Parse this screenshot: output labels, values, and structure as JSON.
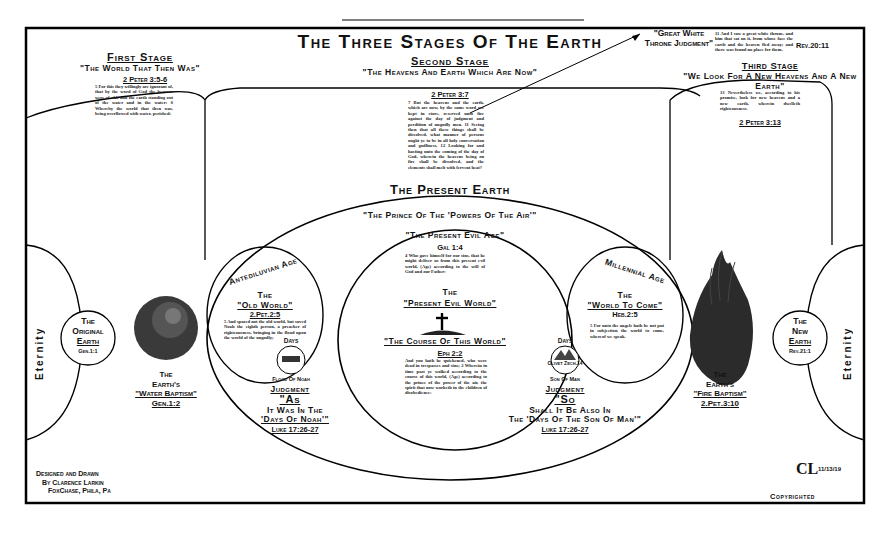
{
  "title": "The Three Stages Of The Earth",
  "first_stage": {
    "heading": "First Stage",
    "subtitle": "\"The World That Then Was\"",
    "reference": "2 Peter 3:5-6",
    "verse": "5 For this they willingly are ignorant of, that by the word of God the heavens were of old, and the earth standing out of the water and in the water: 6 Whereby the world that then was, being overflowed with water, perished:"
  },
  "second_stage": {
    "heading": "Second Stage",
    "subtitle": "\"The Heavens And Earth Which Are Now\"",
    "reference": "2 Peter 3:7",
    "verse": "7 But the heavens and the earth, which are now, by the same word are kept in store, reserved unto fire against the day of judgment and perdition of ungodly men. 11 Seeing then that all these things shall be dissolved, what manner of persons ought ye to be in all holy conversation and godliness, 12 Looking for and hasting unto the coming of the day of God, wherein the heavens being on fire shall be dissolved, and the elements shall melt with fervent heat?"
  },
  "great_white_throne": {
    "label": "\"Great White Throne Judgment\"",
    "verse": "11 And I saw a great white throne, and him that sat on it, from whose face the earth and the heaven fled away; and there was found no place for them.",
    "reference": "Rev.20:11"
  },
  "third_stage": {
    "heading": "Third Stage",
    "subtitle": "\"We Look For A New Heavens And A New Earth\"",
    "verse": "13 Nevertheless we, according to his promise, look for new heavens and a new earth, wherein dwelleth righteousness.",
    "reference": "2 Peter 3:13"
  },
  "present_earth": {
    "heading": "The Present Earth",
    "arc_text": "\"The Prince Of The 'Powers Of The Air'\"",
    "present_evil_age": "\"The Present Evil Age\"",
    "gal_ref": "Gal 1:4",
    "gal_verse": "4 Who gave himself for our sins, that he might deliver us from this present evil world, (Age) according to the will of God and our Father:",
    "present_evil_world_the": "The",
    "present_evil_world": "\"Present Evil World\"",
    "course_of_world": "\"The Course Of This World\"",
    "eph_ref": "Eph 2:2",
    "eph_verse": "And you hath he quickened, who were dead in trespasses and sins; 2 Wherein in time past ye walked according to the course of this world, (Age) according to the prince of the power of the air, the spirit that now worketh in the children of disobedience:"
  },
  "antediluvian": {
    "arc_label": "Antediluvian Age",
    "the": "The",
    "title": "\"Old World\"",
    "reference": "2.Pet.2:5",
    "verse": "5 And spared not the old world, but saved Noah the eighth person, a preacher of righteousness, bringing in the flood upon the world of the ungodly;",
    "badge_top": "Days",
    "badge_bottom": "Flood Of Noah",
    "judgment": "Judgment",
    "as": "\"As",
    "as_line": "It Was In The",
    "days_of_noah": "'Days Of Noah'\"",
    "luke_ref": "Luke 17:26-27"
  },
  "millennial": {
    "arc_label": "Millennial Age",
    "the": "The",
    "title": "\"World To Come\"",
    "reference": "Heb.2:5",
    "verse": "5 For unto the angels hath he not put in subjection the world to come, whereof we speak.",
    "badge_top": "Days",
    "badge_mid": "Olivet Zech.14",
    "badge_bottom": "Son Of Man",
    "judgment": "Judgment",
    "so": "\"So",
    "so_line": "Shall It Be Also In",
    "days_son_of_man": "The 'Days Of The Son Of Man'\"",
    "luke_ref": "Luke 17:26-27"
  },
  "original_earth": {
    "line1": "The",
    "line2": "Original",
    "line3": "Earth",
    "reference": "Gen.1:1"
  },
  "water_baptism": {
    "line1": "The",
    "line2": "Earth's",
    "line3": "\"Water Baptism\"",
    "reference": "Gen.1:2"
  },
  "fire_baptism": {
    "line1": "The",
    "line2": "Earth's",
    "line3": "\"Fire Baptism\"",
    "reference": "2.Pet.3:10"
  },
  "new_earth": {
    "line1": "The",
    "line2": "New",
    "line3": "Earth",
    "reference": "Rev.21:1"
  },
  "eternity_left": "Eternity",
  "eternity_right": "Eternity",
  "credits": {
    "line1": "Designed and Drawn",
    "line2": "By Clarence Larkin",
    "line3": "FoxChase, Phila, Pa"
  },
  "signature": {
    "monogram": "CL",
    "date": "11/13/19",
    "copyright": "Copyrighted"
  }
}
